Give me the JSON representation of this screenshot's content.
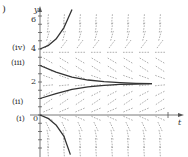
{
  "figure": {
    "panel_marker": ")"
  },
  "chart_data": {
    "type": "line",
    "subtype": "direction-field",
    "title": "",
    "xlabel": "t",
    "ylabel": "y",
    "y_ticks": [
      "0",
      "2",
      "4",
      "6"
    ],
    "ylim": [
      -2.4,
      6.5
    ],
    "xlim": [
      -0.6,
      8.4
    ],
    "grid": false,
    "equilibrium_y": 1.9,
    "series": [
      {
        "name": "(i)",
        "label_y": 0,
        "description": "starts at y=0, decreases rapidly (diverges downward)",
        "points": [
          [
            0,
            0
          ],
          [
            0.5,
            -0.2
          ],
          [
            1,
            -0.6
          ],
          [
            1.5,
            -1.3
          ],
          [
            1.9,
            -2.4
          ]
        ]
      },
      {
        "name": "(ii)",
        "label_y": 1,
        "description": "starts at y=1, increases toward equilibrium",
        "points": [
          [
            0,
            1.0
          ],
          [
            1,
            1.3
          ],
          [
            2,
            1.55
          ],
          [
            3,
            1.7
          ],
          [
            4,
            1.8
          ],
          [
            5,
            1.85
          ],
          [
            6,
            1.88
          ],
          [
            7,
            1.9
          ]
        ]
      },
      {
        "name": "(iii)",
        "label_y": 3,
        "description": "starts at y=3, decreases toward equilibrium",
        "points": [
          [
            0,
            3.0
          ],
          [
            1,
            2.6
          ],
          [
            2,
            2.3
          ],
          [
            3,
            2.12
          ],
          [
            4,
            2.02
          ],
          [
            5,
            1.96
          ],
          [
            6,
            1.92
          ],
          [
            7,
            1.9
          ]
        ]
      },
      {
        "name": "(iv)",
        "label_y": 4,
        "description": "starts at y=4, increases rapidly (diverges upward)",
        "points": [
          [
            0,
            4.0
          ],
          [
            0.5,
            4.2
          ],
          [
            1,
            4.6
          ],
          [
            1.5,
            5.3
          ],
          [
            2,
            6.4
          ]
        ]
      }
    ],
    "curve_labels": [
      "(iv)",
      "(iii)",
      "(ii)",
      "(i)"
    ]
  }
}
